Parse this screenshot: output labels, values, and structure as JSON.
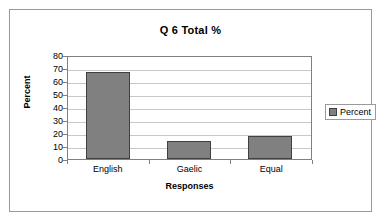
{
  "chart_data": {
    "type": "bar",
    "title": "Q 6 Total %",
    "xlabel": "Responses",
    "ylabel": "Percent",
    "categories": [
      "English",
      "Gaelic",
      "Equal"
    ],
    "values": [
      67,
      14,
      18
    ],
    "series": [
      {
        "name": "Percent",
        "values": [
          67,
          14,
          18
        ]
      }
    ],
    "ylim": [
      0,
      80
    ],
    "ytick_labels": [
      "80",
      "70",
      "60",
      "50",
      "40",
      "30",
      "20",
      "10",
      "0"
    ],
    "ytick_values": [
      80,
      70,
      60,
      50,
      40,
      30,
      20,
      10,
      0
    ],
    "grid": "horizontal",
    "legend_position": "right",
    "legend_entries": [
      "Percent"
    ],
    "colors": {
      "bar_fill": "#808080",
      "bar_border": "#404040",
      "gridline": "#c8c8c8",
      "axis": "#808080",
      "frame": "#9a9a9a",
      "text": "#000000",
      "background": "#ffffff"
    }
  }
}
